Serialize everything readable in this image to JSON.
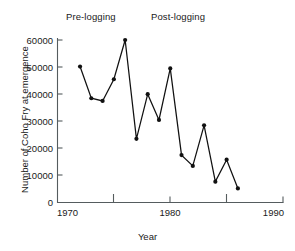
{
  "chart_data": {
    "type": "line",
    "title": "",
    "xlabel": "Year",
    "ylabel": "Number of Coho Fry at emergence",
    "xlim": [
      1970,
      1990
    ],
    "ylim": [
      0,
      60000
    ],
    "grid": false,
    "legend": null,
    "x_ticks": [
      1970,
      1975,
      1980,
      1985,
      1990
    ],
    "x_tick_labels": [
      "1970",
      "",
      "1980",
      "",
      "1990"
    ],
    "y_ticks": [
      0,
      10000,
      20000,
      30000,
      40000,
      50000,
      60000
    ],
    "y_tick_labels": [
      "0",
      "10000",
      "20000",
      "30000",
      "40000",
      "50000",
      "60000"
    ],
    "x": [
      1972,
      1973,
      1974,
      1975,
      1976,
      1977,
      1978,
      1979,
      1980,
      1981,
      1982,
      1983,
      1984,
      1985,
      1986
    ],
    "values": [
      50200,
      38500,
      37500,
      45500,
      60000,
      23500,
      40000,
      30500,
      49500,
      17500,
      13500,
      28500,
      7700,
      15800,
      5200
    ],
    "series": [
      {
        "name": "Coho Fry at emergence",
        "values": [
          50200,
          38500,
          37500,
          45500,
          60000,
          23500,
          40000,
          30500,
          49500,
          17500,
          13500,
          28500,
          7700,
          15800,
          5200
        ]
      }
    ],
    "annotations": [
      {
        "text": "Pre-logging",
        "x": 1975
      },
      {
        "text": "Post-logging",
        "x": 1981
      }
    ],
    "marker": "filled-circle",
    "line_color": "#111111"
  },
  "annotations": {
    "pre_logging": "Pre-logging",
    "post_logging": "Post-logging"
  },
  "axes": {
    "x_title": "Year",
    "y_title": "Number of Coho Fry at emergence",
    "x_labels": [
      "1970",
      "1980",
      "1990"
    ],
    "y_labels": [
      "60000",
      "50000",
      "40000",
      "30000",
      "20000",
      "10000",
      "0"
    ]
  }
}
